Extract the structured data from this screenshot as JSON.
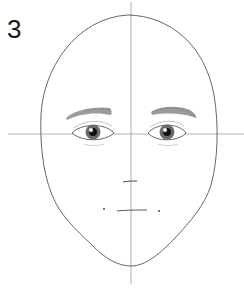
{
  "illustration": {
    "step_label": "3",
    "subject": "face construction drawing",
    "colors": {
      "background": "#ffffff",
      "line": "#555555",
      "guide": "#8a8a8a",
      "iris": "#444444",
      "pupil": "#111111",
      "brow": "#7a7a7a"
    }
  }
}
